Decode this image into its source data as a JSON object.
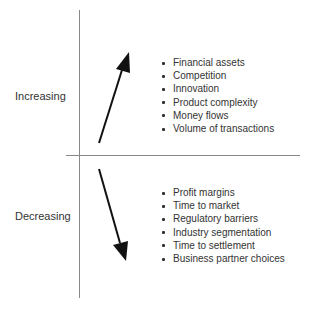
{
  "diagram": {
    "increasing": {
      "label": "Increasing",
      "items": [
        "Financial assets",
        "Competition",
        "Innovation",
        "Product complexity",
        "Money flows",
        "Volume of transactions"
      ]
    },
    "decreasing": {
      "label": "Decreasing",
      "items": [
        "Profit margins",
        "Time to market",
        "Regulatory barriers",
        "Industry segmentation",
        "Time to settlement",
        "Business partner choices"
      ]
    },
    "colors": {
      "axis": "#888888",
      "arrow": "#111111",
      "text": "#333333"
    }
  }
}
